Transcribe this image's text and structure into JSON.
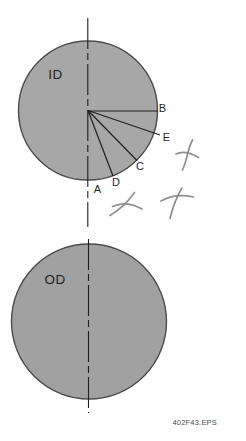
{
  "diagram": {
    "top_circle": {
      "label": "ID"
    },
    "bottom_circle": {
      "label": "OD"
    },
    "point_labels": {
      "A": "A",
      "B": "B",
      "C": "C",
      "D": "D",
      "E": "E"
    },
    "file_reference": "402F43.EPS",
    "colors": {
      "background": "#ffffff",
      "circle_fill_top": "#a7a7a7",
      "circle_fill_bottom": "#a1a1a1",
      "circle_stroke": "#4c4c4c",
      "line": "#1f1f1f",
      "label_text": "#1f1f1f",
      "handwriting": "#8f8f8f",
      "caption_text": "#4a4a4a"
    }
  }
}
